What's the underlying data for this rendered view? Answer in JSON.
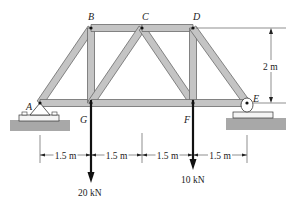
{
  "diagram": {
    "type": "truss",
    "nodes": [
      {
        "id": "A",
        "label": "A"
      },
      {
        "id": "B",
        "label": "B"
      },
      {
        "id": "C",
        "label": "C"
      },
      {
        "id": "D",
        "label": "D"
      },
      {
        "id": "E",
        "label": "E"
      },
      {
        "id": "F",
        "label": "F"
      },
      {
        "id": "G",
        "label": "G"
      }
    ],
    "members": [
      [
        "A",
        "B"
      ],
      [
        "A",
        "G"
      ],
      [
        "B",
        "G"
      ],
      [
        "B",
        "C"
      ],
      [
        "C",
        "G"
      ],
      [
        "C",
        "F"
      ],
      [
        "C",
        "D"
      ],
      [
        "D",
        "F"
      ],
      [
        "D",
        "E"
      ],
      [
        "G",
        "F"
      ],
      [
        "F",
        "E"
      ]
    ],
    "supports": [
      {
        "node": "A",
        "type": "pin"
      },
      {
        "node": "E",
        "type": "roller"
      }
    ],
    "loads": [
      {
        "node": "G",
        "label": "20 kN",
        "direction": "down"
      },
      {
        "node": "F",
        "label": "10 kN",
        "direction": "down"
      }
    ],
    "dimensions": {
      "horizontal": [
        "1.5 m",
        "1.5 m",
        "1.5 m",
        "1.5 m"
      ],
      "height": "2 m"
    },
    "colors": {
      "member_fill": "#c4c4c4",
      "ground_fill": "#a8a8a8",
      "line": "#222222"
    }
  }
}
